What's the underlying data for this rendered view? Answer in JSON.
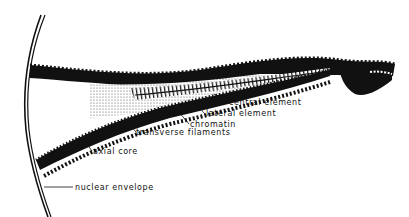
{
  "diagram": {
    "labels": [
      {
        "id": "central-element",
        "text": "central element",
        "x": 229,
        "y": 99
      },
      {
        "id": "lateral-element",
        "text": "lateral element",
        "x": 206,
        "y": 110
      },
      {
        "id": "chromatin",
        "text": "chromatin",
        "x": 190,
        "y": 121
      },
      {
        "id": "transverse-filaments",
        "text": "transverse filaments",
        "x": 136,
        "y": 129
      },
      {
        "id": "axial-core",
        "text": "axial core",
        "x": 93,
        "y": 148
      },
      {
        "id": "nuclear-envelope",
        "text": "nuclear envelope",
        "x": 75,
        "y": 184
      }
    ],
    "colors": {
      "ink": "#111111",
      "background": "#ffffff"
    }
  }
}
